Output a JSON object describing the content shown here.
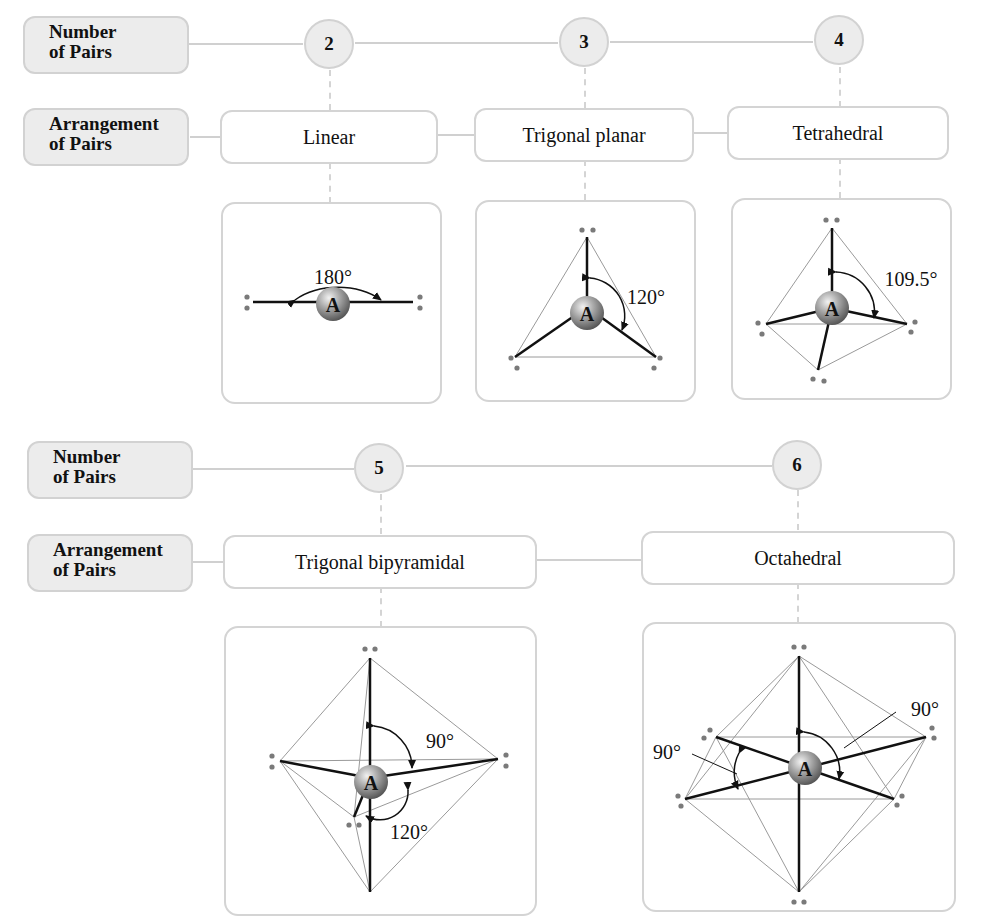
{
  "row_labels": {
    "number": "Number\nof Pairs",
    "number_line1": "Number",
    "number_line2": "of Pairs",
    "arrangement_line1": "Arrangement",
    "arrangement_line2": "of Pairs"
  },
  "geometries": [
    {
      "pairs": "2",
      "name": "Linear",
      "angles": [
        "180°"
      ]
    },
    {
      "pairs": "3",
      "name": "Trigonal planar",
      "angles": [
        "120°"
      ]
    },
    {
      "pairs": "4",
      "name": "Tetrahedral",
      "angles": [
        "109.5°"
      ]
    },
    {
      "pairs": "5",
      "name": "Trigonal bipyramidal",
      "angles": [
        "90°",
        "120°"
      ]
    },
    {
      "pairs": "6",
      "name": "Octahedral",
      "angles": [
        "90°",
        "90°"
      ]
    }
  ],
  "atom_label": "A",
  "colors": {
    "box_fill": "#ececec",
    "box_border": "#d2d2d2",
    "bond": "#111111",
    "edge": "#9a9a9a",
    "lone_pair_dot": "#7a7a7a",
    "atom_ball": "#8a8a8a"
  }
}
